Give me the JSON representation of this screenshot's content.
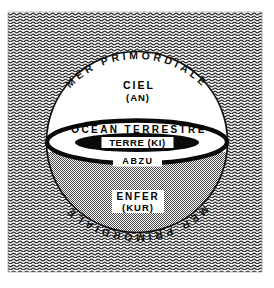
{
  "figure": {
    "background_pattern": "wavy-water-hatching",
    "colors": {
      "ink": "#111111",
      "paper": "#ffffff",
      "sea_hatch": "#333333",
      "netherworld_stipple": "#8a8a8a",
      "earth_disk": "#000000"
    }
  },
  "labels": {
    "arc_top": "MER PRIMORDIALE",
    "arc_bottom": "MER PRIMORDIALE",
    "sky": "CIEL",
    "sky_sub": "(AN)",
    "ocean": "OCÉAN TERRESTRE",
    "earth": "TERRE (KI)",
    "abzu": "ABZU",
    "netherworld": "ENFER",
    "netherworld_sub": "(KUR)"
  },
  "geometry": {
    "circle_center_x": 137,
    "circle_center_y": 142,
    "circle_radius": 91,
    "ocean_band_rx": 91,
    "ocean_band_ry": 22,
    "earth_disk_rx": 63,
    "earth_disk_ry": 10
  }
}
